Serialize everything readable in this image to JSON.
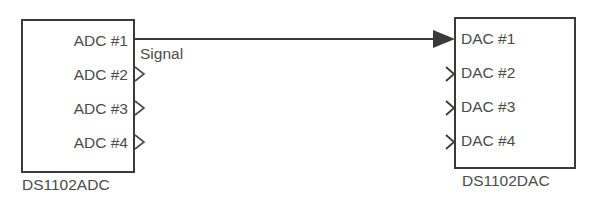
{
  "diagram": {
    "type": "block-diagram",
    "background_color": "#ffffff",
    "line_color": "#3a3a3a",
    "text_color": "#4b4b4b",
    "blocks": [
      {
        "id": "adc",
        "caption": "DS1102ADC",
        "port_direction": "output",
        "ports": [
          {
            "label": "ADC #1",
            "connected": true
          },
          {
            "label": "ADC #2",
            "connected": false
          },
          {
            "label": "ADC #3",
            "connected": false
          },
          {
            "label": "ADC #4",
            "connected": false
          }
        ]
      },
      {
        "id": "dac",
        "caption": "DS1102DAC",
        "port_direction": "input",
        "ports": [
          {
            "label": "DAC #1",
            "connected": true
          },
          {
            "label": "DAC #2",
            "connected": false
          },
          {
            "label": "DAC #3",
            "connected": false
          },
          {
            "label": "DAC #4",
            "connected": false
          }
        ]
      }
    ],
    "connections": [
      {
        "label": "Signal",
        "from_block": "adc",
        "from_port": "ADC #1",
        "to_block": "dac",
        "to_port": "DAC #1",
        "arrow": "filled-triangle"
      }
    ]
  }
}
